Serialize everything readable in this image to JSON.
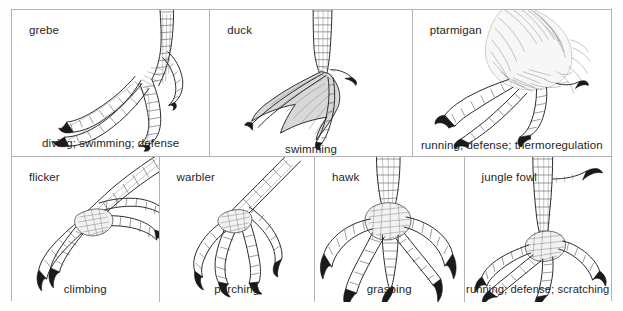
{
  "figure": {
    "name": "bird-foot-types-comparative-plate",
    "rows": [
      {
        "row_name": "top-row",
        "panels": [
          {
            "id": "grebe",
            "title": "grebe",
            "caption": "diving; swimming; defense",
            "foot_type": "lobate"
          },
          {
            "id": "duck",
            "title": "duck",
            "caption": "swimming",
            "foot_type": "palmate-webbed"
          },
          {
            "id": "ptarmigan",
            "title": "ptarmigan",
            "caption": "running; defense; thermoregulation",
            "foot_type": "feathered"
          }
        ]
      },
      {
        "row_name": "bottom-row",
        "panels": [
          {
            "id": "flicker",
            "title": "flicker",
            "caption": "climbing",
            "foot_type": "zygodactyl"
          },
          {
            "id": "warbler",
            "title": "warbler",
            "caption": "perching",
            "foot_type": "anisodactyl-perching"
          },
          {
            "id": "hawk",
            "title": "hawk",
            "caption": "grasping",
            "foot_type": "raptorial"
          },
          {
            "id": "junglefowl",
            "title": "jungle fowl",
            "caption": "running; defense; scratching",
            "foot_type": "cursorial-spurred"
          }
        ]
      }
    ]
  },
  "colors": {
    "page_background": "#fdfdfc",
    "panel_background": "#ffffff",
    "grid_line": "#b3b3b3",
    "ink": "#2a2a2a",
    "claw": "#1a1a1a",
    "web_fill": "#d8d8d8",
    "text": "#1f1f1f"
  }
}
